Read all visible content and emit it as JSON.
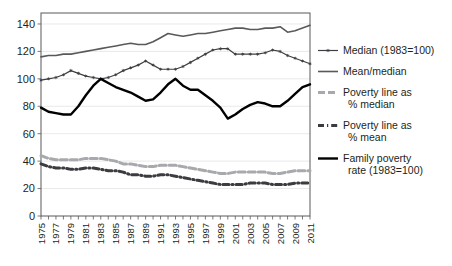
{
  "chart_data": {
    "type": "line",
    "title": "",
    "subtitle": "",
    "xlabel": "",
    "ylabel": "",
    "xlim": [
      1975,
      2011
    ],
    "ylim": [
      0,
      148
    ],
    "yticks": [
      0,
      20,
      40,
      60,
      80,
      100,
      120,
      140
    ],
    "ytick_labels": [
      "0",
      "20",
      "40",
      "60",
      "80",
      "100",
      "120",
      "140"
    ],
    "x": [
      1975,
      1976,
      1977,
      1978,
      1979,
      1980,
      1981,
      1982,
      1983,
      1984,
      1985,
      1986,
      1987,
      1988,
      1989,
      1990,
      1991,
      1992,
      1993,
      1994,
      1995,
      1996,
      1997,
      1998,
      1999,
      2000,
      2001,
      2002,
      2003,
      2004,
      2005,
      2006,
      2007,
      2008,
      2009,
      2010,
      2011
    ],
    "xtick_labels": [
      "1975",
      "1977",
      "1979",
      "1981",
      "1983",
      "1985",
      "1987",
      "1989",
      "1991",
      "1993",
      "1995",
      "1997",
      "1999",
      "2001",
      "2003",
      "2005",
      "2007",
      "2009",
      "2011"
    ],
    "xtick_step": 2,
    "grid": "horizontal",
    "legend_position": "right",
    "series": [
      {
        "name": "Median (1983=100)",
        "legend_key": "median",
        "style": "line-with-markers",
        "color": "#3f3f43",
        "marker": "star",
        "values": [
          99,
          100,
          101,
          103,
          106,
          104,
          102,
          101,
          100,
          101,
          103,
          106,
          108,
          110,
          113,
          110,
          107,
          107,
          107,
          109,
          112,
          115,
          118,
          121,
          122,
          122,
          118,
          118,
          118,
          118,
          119,
          121,
          120,
          117,
          115,
          113,
          111
        ]
      },
      {
        "name": "Mean/median",
        "legend_key": "mean_median",
        "style": "line",
        "color": "#58595b",
        "values": [
          116,
          117,
          117,
          118,
          118,
          119,
          120,
          121,
          122,
          123,
          124,
          125,
          126,
          125,
          125,
          127,
          130,
          133,
          132,
          131,
          132,
          133,
          133,
          134,
          135,
          136,
          137,
          137,
          136,
          136,
          137,
          137,
          138,
          134,
          135,
          137,
          139
        ]
      },
      {
        "name": "Poverty line as % median",
        "legend_key": "poverty_pct_median",
        "style": "dashed",
        "color": "#a7a9ac",
        "values": [
          44,
          42,
          41,
          41,
          41,
          41,
          42,
          42,
          42,
          41,
          40,
          38,
          38,
          37,
          36,
          36,
          37,
          37,
          37,
          36,
          35,
          34,
          33,
          32,
          31,
          31,
          32,
          32,
          32,
          32,
          32,
          31,
          31,
          32,
          33,
          33,
          33
        ]
      },
      {
        "name": "Poverty line as % mean",
        "legend_key": "poverty_pct_mean",
        "style": "dash-dot",
        "color": "#3b3b40",
        "values": [
          38,
          36,
          35,
          35,
          34,
          34,
          35,
          35,
          34,
          33,
          33,
          32,
          30,
          30,
          29,
          29,
          30,
          30,
          29,
          28,
          27,
          26,
          25,
          24,
          23,
          23,
          23,
          23,
          24,
          24,
          24,
          23,
          23,
          23,
          24,
          24,
          24
        ]
      },
      {
        "name": "Family poverty rate (1983=100)",
        "legend_key": "family_poverty_rate",
        "style": "thick-line",
        "color": "#000000",
        "values": [
          79,
          76,
          75,
          74,
          74,
          80,
          88,
          95,
          100,
          97,
          94,
          92,
          90,
          87,
          84,
          85,
          90,
          96,
          100,
          95,
          92,
          92,
          88,
          84,
          79,
          71,
          74,
          78,
          81,
          83,
          82,
          80,
          80,
          84,
          89,
          94,
          96
        ]
      }
    ],
    "legend_entries": [
      {
        "label": "Median (1983=100)",
        "label_line1": "Median (1983=100)",
        "label_line2": "",
        "swatch": "line-with-markers",
        "color": "#3f3f43"
      },
      {
        "label": "Mean/median",
        "label_line1": "Mean/median",
        "label_line2": "",
        "swatch": "line",
        "color": "#58595b"
      },
      {
        "label": "Poverty line as % median",
        "label_line1": "Poverty line as",
        "label_line2": "% median",
        "swatch": "dashed",
        "color": "#a7a9ac"
      },
      {
        "label": "Poverty line as % mean",
        "label_line1": "Poverty line as",
        "label_line2": "% mean",
        "swatch": "dash-dot",
        "color": "#3b3b40"
      },
      {
        "label": "Family poverty rate (1983=100)",
        "label_line1": "Family poverty",
        "label_line2": "rate (1983=100)",
        "swatch": "thick-line",
        "color": "#000000"
      }
    ]
  }
}
